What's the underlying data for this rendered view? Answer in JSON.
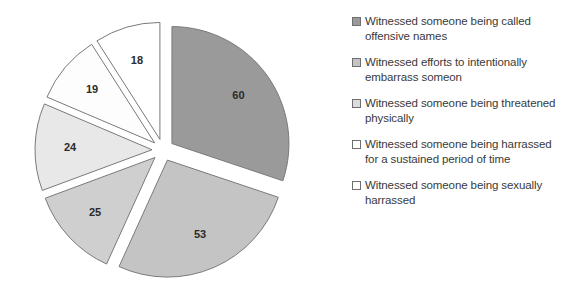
{
  "chart_data": {
    "type": "pie",
    "title": "",
    "subtitle": "",
    "xlabel": "",
    "ylabel": "",
    "grid": false,
    "legend_position": "right",
    "exploded": true,
    "start_angle_deg": 0,
    "direction": "clockwise",
    "total": 199,
    "categories": [
      "Witnessed someone being called offensive names",
      "Witnessed efforts to intentionally embarrass someon",
      "Witnessed someone being threatened physically",
      "Witnessed someone being harrassed for a sustained period of time",
      "Witnessed someone being sexually harrassed",
      "Witnessed someone being sexually harrassed"
    ],
    "values": [
      60,
      53,
      25,
      24,
      19,
      18
    ],
    "data_labels": [
      "60",
      "53",
      "25",
      "24",
      "19",
      "18"
    ],
    "slice_colors": [
      "#9a9a9a",
      "#c4c4c4",
      "#cfcfcf",
      "#e8e8e8",
      "#fdfdfd",
      "#ffffff"
    ],
    "slice_border_color": "#7a7a7a",
    "label_color": "#2b2b2b",
    "background_color": "#ffffff"
  },
  "legend": {
    "items": [
      {
        "label": "Witnessed someone being called offensive names",
        "color": "#9a9a9a"
      },
      {
        "label": "Witnessed efforts to intentionally embarrass someon",
        "color": "#c4c4c4"
      },
      {
        "label": "Witnessed someone being threatened physically",
        "color": "#dcdcdc"
      },
      {
        "label": "Witnessed someone being harrassed for a sustained period of time",
        "color": "#ffffff"
      },
      {
        "label": "Witnessed someone being sexually harrassed",
        "color": "#ffffff"
      }
    ]
  }
}
